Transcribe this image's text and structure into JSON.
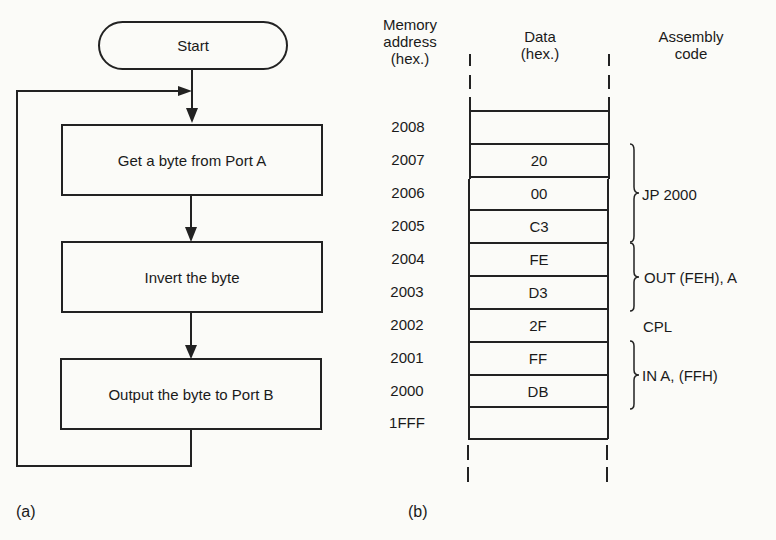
{
  "flowchart": {
    "label": "(a)",
    "start": "Start",
    "steps": [
      "Get a byte from Port A",
      "Invert the byte",
      "Output the byte to Port B"
    ]
  },
  "memory_map": {
    "label": "(b)",
    "headers": {
      "address": [
        "Memory",
        "address",
        "(hex.)"
      ],
      "data": [
        "Data",
        "(hex.)"
      ],
      "assembly": [
        "Assembly",
        "code"
      ]
    },
    "rows": [
      {
        "address": "2008",
        "data": ""
      },
      {
        "address": "2007",
        "data": "20"
      },
      {
        "address": "2006",
        "data": "00"
      },
      {
        "address": "2005",
        "data": "C3"
      },
      {
        "address": "2004",
        "data": "FE"
      },
      {
        "address": "2003",
        "data": "D3"
      },
      {
        "address": "2002",
        "data": "2F"
      },
      {
        "address": "2001",
        "data": "FF"
      },
      {
        "address": "2000",
        "data": "DB"
      },
      {
        "address": "1FFF",
        "data": ""
      }
    ],
    "instructions": [
      {
        "code": "JP 2000",
        "span": [
          "2007",
          "2005"
        ]
      },
      {
        "code": "OUT (FEH), A",
        "span": [
          "2004",
          "2003"
        ]
      },
      {
        "code": "CPL",
        "span": [
          "2002"
        ]
      },
      {
        "code": "IN A, (FFH)",
        "span": [
          "2001",
          "2000"
        ]
      }
    ]
  }
}
